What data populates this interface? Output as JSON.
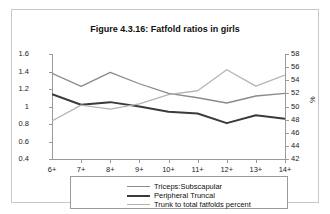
{
  "chart_data": {
    "type": "line",
    "title": "Figure 4.3.16: Fatfold ratios in girls",
    "xlabel": "",
    "ylabel": "",
    "y2label": "%",
    "categories": [
      "6+",
      "7+",
      "8+",
      "9+",
      "10+",
      "11+",
      "12+",
      "13+",
      "14+"
    ],
    "ylim": [
      0.4,
      1.6
    ],
    "y2lim": [
      42,
      58
    ],
    "yticks": [
      "1.6",
      "1.4",
      "1.2",
      "1",
      "0.8",
      "0.6",
      "0.4"
    ],
    "y2ticks": [
      "58",
      "56",
      "54",
      "52",
      "50",
      "48",
      "46",
      "44",
      "42"
    ],
    "grid": false,
    "legend_position": "bottom",
    "series": [
      {
        "name": "Triceps:Subscapular",
        "axis": "left",
        "color": "#8a8a8a",
        "width": 1.3,
        "values": [
          1.38,
          1.23,
          1.39,
          1.26,
          1.15,
          1.1,
          1.04,
          1.12,
          1.15
        ]
      },
      {
        "name": "Peripheral Truncal",
        "axis": "left",
        "color": "#3a3a3a",
        "width": 2.0,
        "values": [
          1.14,
          1.02,
          1.05,
          1.0,
          0.94,
          0.92,
          0.81,
          0.9,
          0.86
        ]
      },
      {
        "name": "Trunk to total fatfolds percent",
        "axis": "right",
        "color": "#b4b4b4",
        "width": 1.3,
        "values": [
          47.8,
          50.2,
          49.6,
          50.4,
          51.8,
          52.4,
          55.6,
          53.1,
          54.8
        ]
      }
    ]
  }
}
